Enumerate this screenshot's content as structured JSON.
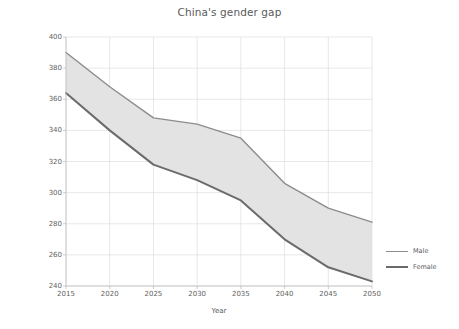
{
  "chart_data": {
    "type": "area",
    "title": "China's gender gap",
    "xlabel": "Year",
    "ylabel": "Population 15-49 in millions",
    "x": [
      2015,
      2020,
      2025,
      2030,
      2035,
      2040,
      2045,
      2050
    ],
    "xticks": [
      "2015",
      "2020",
      "2025",
      "2030",
      "2035",
      "2040",
      "2045",
      "2050"
    ],
    "yticks": [
      "240",
      "260",
      "280",
      "300",
      "320",
      "340",
      "360",
      "380",
      "400"
    ],
    "xlim": [
      2015,
      2050
    ],
    "ylim": [
      240,
      400
    ],
    "grid": "vertical-and-horizontal-light",
    "legend_position": "right",
    "series": [
      {
        "name": "Male",
        "color": "#8c8c8c",
        "values": [
          390,
          368,
          348,
          344,
          335,
          306,
          290,
          281
        ]
      },
      {
        "name": "Female",
        "color": "#6b6b6b",
        "values": [
          364,
          340,
          318,
          308,
          295,
          270,
          252,
          243
        ]
      }
    ],
    "fill_between_color": "#e3e3e3",
    "fill_label": "gap between male and female population"
  },
  "legend": {
    "items": [
      {
        "label": "Male",
        "color": "#8c8c8c",
        "width": "1.4px"
      },
      {
        "label": "Female",
        "color": "#6b6b6b",
        "width": "2.2px"
      }
    ]
  }
}
